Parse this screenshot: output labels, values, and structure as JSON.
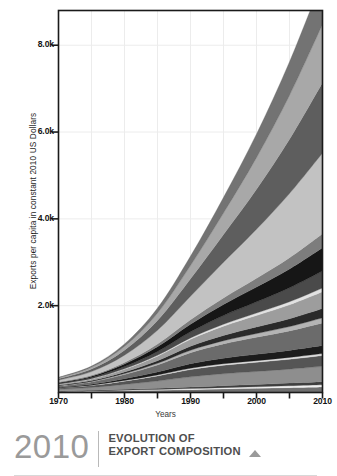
{
  "caption": {
    "year": "2010",
    "line1": "EVOLUTION OF",
    "line2": "EXPORT COMPOSITION",
    "marker_icon": "triangle-up-icon"
  },
  "chart_data": {
    "type": "area",
    "title": "",
    "subtitle": "",
    "xlabel": "Years",
    "ylabel": "Exports per capita in constant 2010 US Dollars",
    "stacked": true,
    "grid": true,
    "legend": "none",
    "xlim": [
      1970,
      2010
    ],
    "ylim": [
      0,
      8800
    ],
    "xticks": [
      1970,
      1980,
      1990,
      2000,
      2010
    ],
    "xtick_labels": [
      "1970",
      "1980",
      "1990",
      "2000",
      "2010"
    ],
    "x_minor_ticks": [
      1975,
      1985,
      1995,
      2005
    ],
    "yticks": [
      2000,
      4000,
      6000,
      8000
    ],
    "ytick_labels": [
      "2.0k",
      "4.0k",
      "6.0k",
      "8.0k"
    ],
    "x": [
      1970,
      1975,
      1980,
      1985,
      1990,
      1995,
      2000,
      2005,
      2010
    ],
    "series": [
      {
        "name": "layer-01",
        "color": "#6f6f6f",
        "values": [
          18,
          26,
          40,
          52,
          66,
          82,
          96,
          112,
          128
        ]
      },
      {
        "name": "layer-02",
        "color": "#f0f0f0",
        "values": [
          6,
          9,
          14,
          18,
          24,
          30,
          36,
          42,
          50
        ]
      },
      {
        "name": "layer-03",
        "color": "#3f3f3f",
        "values": [
          10,
          14,
          20,
          26,
          34,
          44,
          52,
          62,
          72
        ]
      },
      {
        "name": "layer-04",
        "color": "#8e8e8e",
        "values": [
          40,
          66,
          112,
          168,
          236,
          276,
          300,
          322,
          352
        ]
      },
      {
        "name": "layer-05",
        "color": "#555555",
        "values": [
          26,
          44,
          76,
          118,
          170,
          196,
          212,
          228,
          248
        ]
      },
      {
        "name": "layer-06",
        "color": "#dcdcdc",
        "values": [
          5,
          8,
          13,
          20,
          28,
          34,
          38,
          42,
          48
        ]
      },
      {
        "name": "layer-07",
        "color": "#1c1c1c",
        "values": [
          14,
          24,
          42,
          70,
          104,
          128,
          146,
          162,
          184
        ]
      },
      {
        "name": "layer-08",
        "color": "#6b6b6b",
        "values": [
          30,
          52,
          96,
          162,
          254,
          330,
          392,
          448,
          520
        ]
      },
      {
        "name": "layer-09",
        "color": "#b4b4b4",
        "values": [
          8,
          13,
          23,
          38,
          56,
          72,
          86,
          100,
          118
        ]
      },
      {
        "name": "layer-10",
        "color": "#2a2a2a",
        "values": [
          12,
          20,
          36,
          60,
          92,
          122,
          150,
          180,
          214
        ]
      },
      {
        "name": "layer-11",
        "color": "#9d9d9d",
        "values": [
          20,
          34,
          62,
          104,
          160,
          214,
          266,
          322,
          386
        ]
      },
      {
        "name": "layer-12",
        "color": "#e2e2e2",
        "values": [
          4,
          7,
          12,
          20,
          32,
          44,
          56,
          70,
          86
        ]
      },
      {
        "name": "layer-13",
        "color": "#4a4a4a",
        "values": [
          16,
          28,
          52,
          90,
          142,
          200,
          258,
          322,
          392
        ]
      },
      {
        "name": "layer-14",
        "color": "#161616",
        "values": [
          18,
          32,
          60,
          108,
          176,
          256,
          340,
          432,
          536
        ]
      },
      {
        "name": "layer-15",
        "color": "#7d7d7d",
        "values": [
          10,
          18,
          34,
          62,
          102,
          150,
          202,
          260,
          324
        ]
      },
      {
        "name": "layer-16",
        "color": "#c2c2c2",
        "values": [
          46,
          86,
          168,
          316,
          540,
          820,
          1130,
          1480,
          1860
        ]
      },
      {
        "name": "layer-17",
        "color": "#5e5e5e",
        "values": [
          30,
          58,
          116,
          226,
          402,
          640,
          920,
          1250,
          1620
        ]
      },
      {
        "name": "layer-18",
        "color": "#a8a8a8",
        "values": [
          22,
          42,
          86,
          170,
          306,
          496,
          730,
          1010,
          1340
        ]
      },
      {
        "name": "layer-19",
        "color": "#737373",
        "values": [
          14,
          28,
          58,
          118,
          218,
          362,
          546,
          776,
          1050
        ]
      }
    ]
  }
}
